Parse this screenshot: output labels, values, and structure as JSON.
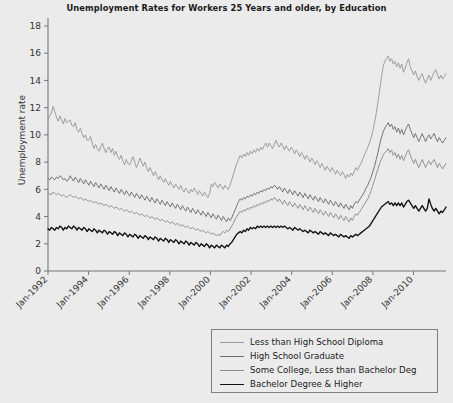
{
  "chart_data": {
    "type": "line",
    "title": "Unemployment Rates for Workers 25 Years and older, by Education",
    "xlabel": "",
    "ylabel": "Unemployment rate",
    "ylim": [
      0,
      18
    ],
    "yticks": [
      0,
      2,
      4,
      6,
      8,
      10,
      12,
      14,
      16,
      18
    ],
    "xtick_labels": [
      "Jan-1992",
      "Jan-1994",
      "Jan-1996",
      "Jan-1998",
      "Jan-2000",
      "Jan-2002",
      "Jan-2004",
      "Jan-2006",
      "Jan-2008",
      "Jan-2010"
    ],
    "xtick_years": [
      1992,
      1994,
      1996,
      1998,
      2000,
      2002,
      2004,
      2006,
      2008,
      2010
    ],
    "x_start_year": 1992.0,
    "x_end_year": 2011.6,
    "grid": false,
    "legend_position": "below-right",
    "series": [
      {
        "name": "Less than High School Diploma",
        "color": "#9a9a9a",
        "values": [
          11.1,
          11.4,
          11.6,
          12.1,
          11.7,
          11.3,
          11.0,
          11.4,
          11.1,
          10.8,
          11.2,
          10.9,
          11.0,
          11.1,
          10.7,
          10.6,
          10.9,
          10.4,
          10.2,
          10.5,
          10.1,
          9.8,
          10.0,
          9.6,
          9.6,
          9.9,
          9.4,
          9.0,
          9.3,
          9.0,
          8.8,
          9.1,
          9.4,
          9.0,
          8.7,
          9.0,
          9.1,
          8.7,
          9.0,
          8.5,
          8.8,
          8.4,
          8.2,
          8.5,
          8.1,
          7.8,
          8.2,
          7.9,
          7.8,
          8.1,
          8.4,
          8.0,
          7.6,
          7.9,
          8.3,
          8.0,
          7.7,
          8.0,
          7.6,
          7.3,
          7.6,
          7.3,
          7.0,
          7.3,
          7.0,
          6.7,
          7.0,
          6.7,
          6.5,
          6.8,
          6.5,
          6.3,
          6.6,
          6.3,
          6.1,
          6.4,
          6.2,
          6.0,
          6.3,
          6.0,
          5.8,
          6.1,
          5.9,
          5.7,
          6.0,
          5.8,
          6.1,
          5.9,
          5.6,
          5.9,
          5.7,
          5.5,
          5.8,
          5.6,
          5.4,
          5.7,
          6.4,
          6.2,
          6.5,
          6.3,
          6.1,
          6.4,
          6.2,
          6.0,
          6.3,
          6.1,
          6.0,
          6.3,
          6.7,
          7.1,
          7.5,
          7.9,
          8.2,
          8.5,
          8.3,
          8.6,
          8.4,
          8.7,
          8.5,
          8.8,
          8.6,
          8.9,
          8.7,
          9.0,
          8.8,
          9.1,
          8.9,
          9.2,
          9.4,
          9.1,
          9.4,
          9.2,
          9.0,
          9.3,
          9.6,
          9.3,
          9.1,
          9.4,
          9.2,
          8.9,
          9.2,
          9.0,
          8.8,
          9.1,
          8.9,
          8.6,
          8.9,
          8.7,
          8.4,
          8.7,
          8.5,
          8.2,
          8.5,
          8.3,
          8.0,
          8.3,
          8.1,
          7.8,
          8.1,
          7.9,
          7.6,
          7.9,
          7.7,
          7.4,
          7.7,
          7.5,
          7.3,
          7.6,
          7.4,
          7.1,
          7.4,
          7.2,
          7.0,
          7.3,
          7.1,
          6.8,
          7.1,
          6.9,
          7.2,
          7.0,
          7.3,
          7.6,
          7.4,
          7.7,
          7.9,
          8.2,
          8.5,
          8.8,
          9.1,
          9.4,
          9.8,
          10.3,
          10.9,
          11.6,
          12.4,
          13.3,
          14.2,
          15.0,
          15.4,
          15.6,
          15.8,
          15.4,
          15.6,
          15.2,
          15.4,
          15.0,
          15.3,
          14.9,
          15.2,
          14.6,
          14.9,
          15.3,
          15.6,
          15.0,
          14.7,
          14.4,
          14.7,
          14.3,
          14.0,
          14.3,
          14.5,
          14.1,
          13.8,
          14.1,
          14.4,
          14.0,
          14.3,
          14.6,
          14.8,
          14.4,
          14.1,
          14.4,
          14.1,
          14.3,
          14.5
        ]
      },
      {
        "name": "High School Graduate",
        "color": "#6e6e6e",
        "values": [
          6.8,
          6.7,
          6.9,
          6.8,
          6.7,
          6.9,
          6.8,
          7.0,
          6.9,
          6.7,
          6.8,
          6.6,
          6.7,
          7.0,
          6.8,
          6.6,
          6.9,
          6.7,
          6.5,
          6.8,
          6.6,
          6.4,
          6.7,
          6.5,
          6.3,
          6.6,
          6.4,
          6.2,
          6.5,
          6.3,
          6.1,
          6.4,
          6.2,
          6.0,
          6.3,
          6.1,
          5.9,
          6.2,
          6.0,
          5.8,
          6.1,
          5.9,
          5.7,
          6.0,
          5.8,
          5.6,
          5.9,
          5.7,
          5.5,
          5.8,
          5.6,
          5.4,
          5.7,
          5.5,
          5.3,
          5.6,
          5.4,
          5.2,
          5.5,
          5.3,
          5.1,
          5.4,
          5.2,
          5.0,
          5.3,
          5.1,
          4.9,
          5.2,
          5.0,
          4.8,
          5.1,
          4.9,
          4.7,
          5.0,
          4.8,
          4.6,
          4.9,
          4.7,
          4.5,
          4.8,
          4.6,
          4.4,
          4.7,
          4.5,
          4.3,
          4.6,
          4.4,
          4.2,
          4.5,
          4.3,
          4.1,
          4.4,
          4.2,
          4.0,
          4.3,
          4.1,
          3.9,
          4.2,
          4.0,
          3.8,
          4.1,
          3.9,
          3.7,
          4.0,
          3.8,
          3.6,
          3.9,
          3.7,
          3.9,
          4.2,
          4.5,
          4.8,
          5.1,
          5.3,
          5.2,
          5.4,
          5.3,
          5.5,
          5.4,
          5.6,
          5.5,
          5.7,
          5.6,
          5.8,
          5.7,
          5.9,
          5.8,
          6.0,
          5.9,
          6.1,
          6.0,
          6.2,
          6.1,
          6.3,
          6.2,
          6.0,
          6.2,
          6.0,
          5.8,
          6.1,
          5.9,
          5.7,
          6.0,
          5.8,
          5.6,
          5.9,
          5.7,
          5.5,
          5.8,
          5.6,
          5.4,
          5.7,
          5.5,
          5.3,
          5.6,
          5.4,
          5.2,
          5.5,
          5.3,
          5.1,
          5.4,
          5.2,
          5.0,
          5.3,
          5.1,
          4.9,
          5.2,
          5.0,
          4.8,
          5.1,
          4.9,
          4.7,
          5.0,
          4.8,
          4.6,
          4.9,
          4.7,
          4.5,
          4.8,
          4.6,
          4.9,
          5.1,
          5.0,
          5.2,
          5.4,
          5.6,
          5.8,
          6.1,
          6.3,
          6.6,
          6.9,
          7.3,
          7.7,
          8.2,
          8.7,
          9.3,
          9.8,
          10.2,
          10.5,
          10.7,
          10.9,
          10.6,
          10.8,
          10.4,
          10.6,
          10.2,
          10.5,
          10.1,
          10.4,
          10.0,
          10.3,
          10.6,
          10.8,
          10.4,
          10.1,
          9.8,
          10.1,
          9.8,
          9.5,
          9.8,
          10.1,
          9.8,
          9.5,
          9.8,
          10.0,
          9.7,
          9.9,
          10.1,
          9.8,
          9.5,
          9.8,
          9.6,
          9.4,
          9.6,
          9.8
        ]
      },
      {
        "name": "Some College, Less than Bachelor Deg",
        "color": "#8d8d8d",
        "values": [
          5.6,
          5.7,
          5.6,
          5.8,
          5.7,
          5.6,
          5.7,
          5.6,
          5.5,
          5.6,
          5.5,
          5.4,
          5.5,
          5.6,
          5.5,
          5.4,
          5.5,
          5.4,
          5.3,
          5.4,
          5.3,
          5.2,
          5.3,
          5.2,
          5.1,
          5.2,
          5.1,
          5.0,
          5.1,
          5.0,
          4.9,
          5.0,
          4.9,
          4.8,
          4.9,
          4.8,
          4.7,
          4.8,
          4.7,
          4.6,
          4.7,
          4.6,
          4.5,
          4.6,
          4.5,
          4.4,
          4.5,
          4.4,
          4.3,
          4.4,
          4.3,
          4.2,
          4.3,
          4.2,
          4.1,
          4.2,
          4.1,
          4.0,
          4.1,
          4.0,
          3.9,
          4.0,
          3.9,
          3.8,
          3.9,
          3.8,
          3.7,
          3.8,
          3.7,
          3.6,
          3.7,
          3.6,
          3.5,
          3.6,
          3.5,
          3.4,
          3.5,
          3.4,
          3.3,
          3.4,
          3.3,
          3.2,
          3.3,
          3.2,
          3.1,
          3.2,
          3.1,
          3.0,
          3.1,
          3.0,
          2.9,
          3.0,
          2.9,
          2.8,
          2.9,
          2.8,
          2.7,
          2.8,
          2.7,
          2.6,
          2.7,
          2.6,
          2.8,
          2.9,
          2.8,
          3.0,
          2.9,
          3.1,
          3.3,
          3.5,
          3.8,
          4.0,
          4.2,
          4.4,
          4.3,
          4.5,
          4.4,
          4.6,
          4.5,
          4.7,
          4.6,
          4.8,
          4.7,
          4.9,
          4.8,
          5.0,
          4.9,
          5.1,
          5.0,
          5.2,
          5.1,
          5.3,
          5.2,
          5.4,
          5.3,
          5.1,
          5.3,
          5.1,
          4.9,
          5.2,
          5.0,
          4.8,
          5.1,
          4.9,
          4.7,
          5.0,
          4.8,
          4.6,
          4.9,
          4.7,
          4.5,
          4.8,
          4.6,
          4.4,
          4.7,
          4.5,
          4.3,
          4.6,
          4.4,
          4.2,
          4.5,
          4.3,
          4.1,
          4.4,
          4.2,
          4.0,
          4.3,
          4.1,
          3.9,
          4.2,
          4.0,
          3.8,
          4.1,
          3.9,
          3.7,
          4.0,
          3.8,
          3.6,
          3.9,
          3.7,
          4.0,
          4.2,
          4.1,
          4.3,
          4.5,
          4.7,
          4.9,
          5.1,
          5.3,
          5.6,
          5.9,
          6.3,
          6.7,
          7.1,
          7.5,
          7.9,
          8.2,
          8.5,
          8.7,
          8.8,
          9.0,
          8.7,
          8.9,
          8.5,
          8.7,
          8.3,
          8.6,
          8.2,
          8.5,
          8.1,
          8.4,
          8.7,
          8.9,
          8.5,
          8.2,
          7.9,
          8.2,
          7.9,
          7.6,
          7.9,
          8.2,
          7.9,
          7.6,
          7.9,
          8.1,
          7.8,
          8.0,
          8.2,
          7.9,
          7.6,
          7.9,
          7.7,
          7.5,
          7.7,
          7.9
        ]
      },
      {
        "name": "Bachelor Degree & Higher",
        "color": "#111111",
        "values": [
          3.1,
          3.0,
          3.2,
          3.1,
          3.0,
          3.2,
          3.1,
          3.3,
          3.2,
          3.0,
          3.2,
          3.1,
          3.3,
          3.2,
          3.1,
          3.3,
          3.2,
          3.0,
          3.2,
          3.1,
          3.0,
          3.2,
          3.1,
          2.9,
          3.1,
          3.0,
          2.9,
          3.1,
          3.0,
          2.8,
          3.0,
          2.9,
          2.8,
          3.0,
          2.9,
          2.7,
          2.9,
          2.8,
          2.7,
          2.9,
          2.8,
          2.6,
          2.8,
          2.7,
          2.6,
          2.8,
          2.7,
          2.5,
          2.7,
          2.6,
          2.5,
          2.7,
          2.6,
          2.4,
          2.6,
          2.5,
          2.4,
          2.6,
          2.5,
          2.3,
          2.5,
          2.4,
          2.3,
          2.5,
          2.4,
          2.2,
          2.4,
          2.3,
          2.2,
          2.4,
          2.3,
          2.1,
          2.3,
          2.2,
          2.1,
          2.3,
          2.2,
          2.0,
          2.2,
          2.1,
          2.0,
          2.2,
          2.1,
          1.9,
          2.1,
          2.0,
          1.9,
          2.1,
          2.0,
          1.8,
          2.0,
          1.9,
          1.8,
          2.0,
          1.9,
          1.7,
          1.9,
          1.8,
          1.7,
          1.9,
          1.8,
          1.7,
          1.9,
          1.8,
          1.7,
          1.9,
          1.8,
          2.0,
          2.1,
          2.3,
          2.5,
          2.7,
          2.8,
          2.9,
          2.8,
          3.0,
          2.9,
          3.1,
          3.0,
          3.2,
          3.1,
          3.2,
          3.1,
          3.3,
          3.2,
          3.3,
          3.2,
          3.3,
          3.2,
          3.3,
          3.2,
          3.3,
          3.2,
          3.3,
          3.2,
          3.3,
          3.2,
          3.3,
          3.2,
          3.3,
          3.2,
          3.1,
          3.2,
          3.1,
          3.0,
          3.2,
          3.1,
          3.0,
          3.1,
          3.0,
          2.9,
          3.0,
          2.9,
          2.8,
          3.0,
          2.9,
          2.8,
          2.9,
          2.8,
          2.7,
          2.9,
          2.8,
          2.7,
          2.8,
          2.7,
          2.6,
          2.8,
          2.7,
          2.6,
          2.7,
          2.6,
          2.5,
          2.7,
          2.6,
          2.5,
          2.6,
          2.5,
          2.4,
          2.6,
          2.5,
          2.6,
          2.7,
          2.6,
          2.7,
          2.8,
          2.9,
          3.0,
          3.1,
          3.2,
          3.3,
          3.5,
          3.7,
          3.9,
          4.1,
          4.3,
          4.5,
          4.7,
          4.8,
          4.9,
          5.0,
          5.1,
          4.9,
          5.0,
          4.8,
          5.0,
          4.8,
          5.0,
          4.8,
          5.0,
          4.7,
          4.9,
          5.1,
          5.2,
          5.0,
          4.8,
          4.6,
          4.8,
          4.6,
          4.4,
          4.6,
          4.8,
          4.6,
          4.4,
          4.6,
          5.3,
          4.9,
          4.6,
          4.4,
          4.6,
          4.4,
          4.2,
          4.4,
          4.3,
          4.5,
          4.7
        ]
      }
    ]
  }
}
